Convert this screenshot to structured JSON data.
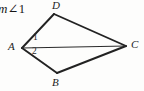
{
  "figure": {
    "prompt": {
      "measure_prefix": "m",
      "angle_symbol": "∠",
      "angle_number": "1",
      "full_text": "m∠1"
    },
    "shape_name": "kite-ADCB-with-diagonal",
    "background_color": "#fdfdfc",
    "stroke_color": "#222222",
    "vertices": [
      {
        "id": "D",
        "label": "D",
        "x": 54,
        "y": 14
      },
      {
        "id": "A",
        "label": "A",
        "x": 22,
        "y": 48
      },
      {
        "id": "C",
        "label": "C",
        "x": 126,
        "y": 46
      },
      {
        "id": "B",
        "label": "B",
        "x": 57,
        "y": 73
      }
    ],
    "edges": [
      {
        "id": "AD",
        "from": "A",
        "to": "D",
        "weight": "thick"
      },
      {
        "id": "DC",
        "from": "D",
        "to": "C",
        "weight": "thick"
      },
      {
        "id": "CB",
        "from": "C",
        "to": "B",
        "weight": "thick"
      },
      {
        "id": "BA",
        "from": "B",
        "to": "A",
        "weight": "thick"
      },
      {
        "id": "AC",
        "from": "A",
        "to": "C",
        "weight": "thin",
        "role": "diagonal"
      }
    ],
    "angle_labels": [
      {
        "id": "1",
        "label": "1",
        "at_vertex": "A",
        "region": "upper",
        "x": 33,
        "y": 38
      },
      {
        "id": "2",
        "label": "2",
        "at_vertex": "A",
        "region": "lower",
        "x": 33,
        "y": 53
      }
    ]
  }
}
